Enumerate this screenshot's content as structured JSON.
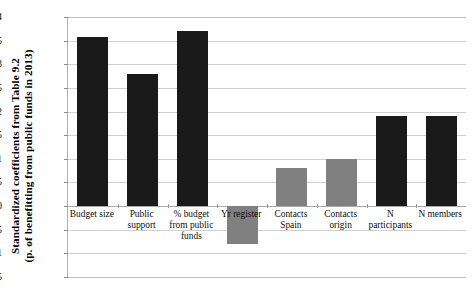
{
  "chart_data": {
    "type": "bar",
    "title": "",
    "subtitle": "",
    "xlabel": "",
    "ylabel": "Standardized coefficients from Table 9.2 (p. of benefitting from public funds in 2013)",
    "ylabel_lines": [
      "Standardized coefficients from Table 9.2",
      "(p. of benefitting from public funds in 2013)"
    ],
    "categories": [
      "Budget size",
      "Public support",
      "% budget from public funds",
      "Yr register",
      "Contacts Spain",
      "Contacts origin",
      "N participants",
      "N members"
    ],
    "values": [
      0.358,
      0.28,
      0.37,
      -0.08,
      0.08,
      0.1,
      0.19,
      0.19
    ],
    "bar_colors": [
      "#1a1a1a",
      "#1a1a1a",
      "#1a1a1a",
      "#808080",
      "#808080",
      "#808080",
      "#1a1a1a",
      "#1a1a1a"
    ],
    "ylim": [
      -0.15,
      0.4
    ],
    "ytick_values": [
      0.4,
      0.35,
      0.3,
      0.25,
      0.2,
      0.15,
      0.1,
      0.05,
      0,
      -0.05,
      -0.1,
      -0.15
    ],
    "ytick_labels": [
      "0.4",
      "0.35",
      "0.3",
      "0.25",
      "0.2",
      "0.15",
      "0.1",
      "0.05",
      "0",
      "-0.05",
      "-0.1",
      "-0.15"
    ],
    "grid": true,
    "legend": false,
    "legend_position": "none"
  }
}
